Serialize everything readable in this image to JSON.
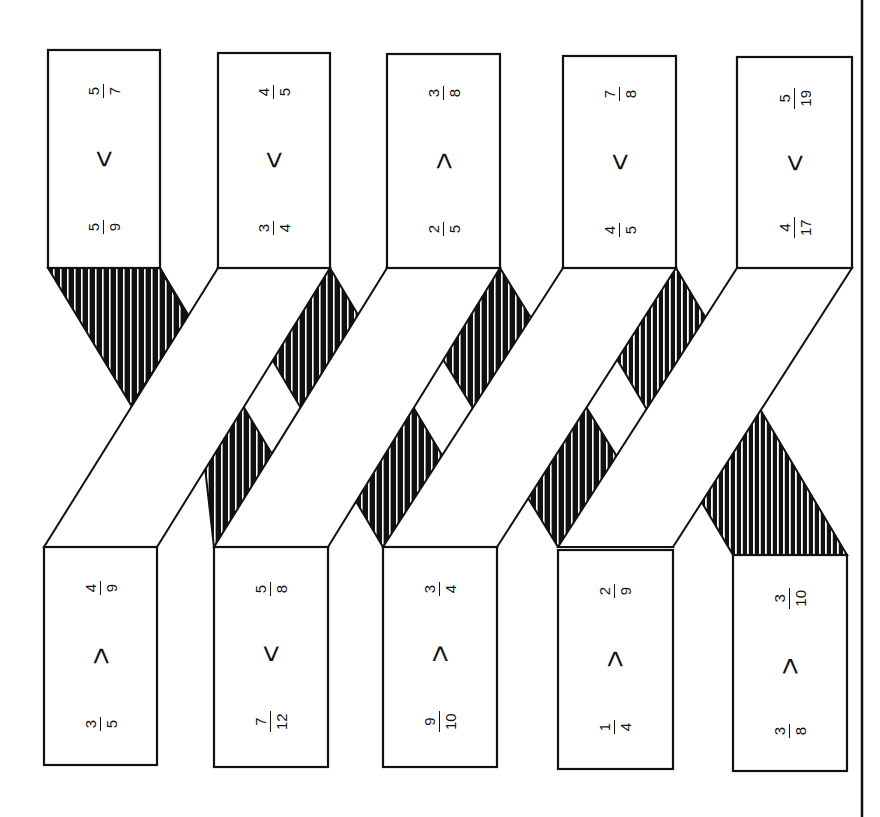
{
  "orientation": "rotated 90 degrees counterclockwise",
  "colors": {
    "ink": "#111111",
    "paper": "#ffffff"
  },
  "top_cards": [
    {
      "left": {
        "num": "5",
        "den": "9"
      },
      "op": "<",
      "right": {
        "num": "5",
        "den": "7"
      }
    },
    {
      "left": {
        "num": "3",
        "den": "4"
      },
      "op": "<",
      "right": {
        "num": "4",
        "den": "5"
      }
    },
    {
      "left": {
        "num": "2",
        "den": "5"
      },
      "op": ">",
      "right": {
        "num": "3",
        "den": "8"
      }
    },
    {
      "left": {
        "num": "4",
        "den": "5"
      },
      "op": "<",
      "right": {
        "num": "7",
        "den": "8"
      }
    },
    {
      "left": {
        "num": "4",
        "den": "17"
      },
      "op": "<",
      "right": {
        "num": "5",
        "den": "19"
      }
    }
  ],
  "bottom_cards": [
    {
      "left": {
        "num": "3",
        "den": "5"
      },
      "op": ">",
      "right": {
        "num": "4",
        "den": "9"
      }
    },
    {
      "left": {
        "num": "7",
        "den": "12"
      },
      "op": "<",
      "right": {
        "num": "5",
        "den": "8"
      }
    },
    {
      "left": {
        "num": "9",
        "den": "10"
      },
      "op": ">",
      "right": {
        "num": "3",
        "den": "4"
      }
    },
    {
      "left": {
        "num": "1",
        "den": "4"
      },
      "op": ">",
      "right": {
        "num": "2",
        "den": "9"
      }
    },
    {
      "left": {
        "num": "3",
        "den": "8"
      },
      "op": ">",
      "right": {
        "num": "3",
        "den": "10"
      }
    }
  ]
}
